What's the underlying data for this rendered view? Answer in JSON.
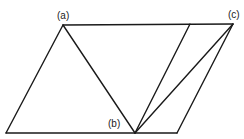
{
  "diagram": {
    "type": "geometry-figure",
    "labels": {
      "a": "(a)",
      "b": "(b)",
      "c": "(c)"
    },
    "points": {
      "a": [
        63,
        25
      ],
      "b": [
        135,
        133
      ],
      "c": [
        233,
        24
      ],
      "top_inner": [
        190,
        24
      ],
      "bottom_left": [
        6,
        133
      ],
      "bottom_right": [
        177,
        133
      ]
    },
    "colors": {
      "line": "#1a1a1a",
      "background": "#ffffff"
    }
  }
}
